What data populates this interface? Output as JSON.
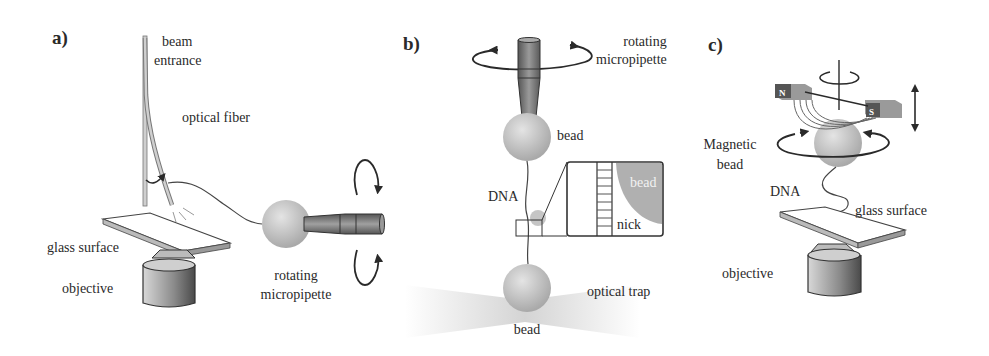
{
  "figure": {
    "panels": [
      {
        "id": "a",
        "label": "a)",
        "labels": {
          "beam_entrance_1": "beam",
          "beam_entrance_2": "entrance",
          "optical_fiber": "optical fiber",
          "glass_surface": "glass surface",
          "objective": "objective",
          "rotating": "rotating",
          "micropipette": "micropipette"
        }
      },
      {
        "id": "b",
        "label": "b)",
        "labels": {
          "rotating": "rotating",
          "micropipette": "micropipette",
          "bead_top": "bead",
          "dna": "DNA",
          "inset_bead": "bead",
          "nick": "nick",
          "optical_trap": "optical trap",
          "bead_bottom": "bead"
        }
      },
      {
        "id": "c",
        "label": "c)",
        "labels": {
          "magnet_n": "N",
          "magnet_s": "S",
          "magnetic_1": "Magnetic",
          "magnetic_2": "bead",
          "dna": "DNA",
          "glass_surface": "glass surface",
          "objective": "objective"
        }
      }
    ],
    "colors": {
      "background": "#ffffff",
      "line": "#2a2a2a",
      "bead": "#bdbdbd",
      "pipette": "#7a7a7a",
      "magnet": "#6e6e6e",
      "trap": "#d6d6d6"
    }
  }
}
